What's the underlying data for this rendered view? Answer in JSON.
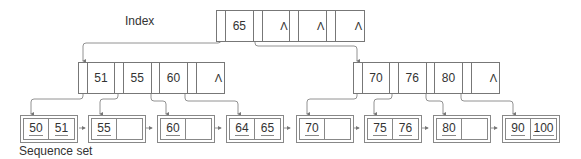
{
  "labels": {
    "index": "Index",
    "sequence_set": "Sequence set"
  },
  "root": {
    "keys": [
      "65",
      "",
      "",
      ""
    ],
    "null_markers": [
      "Λ",
      "Λ",
      "Λ"
    ]
  },
  "internal_nodes": [
    {
      "keys": [
        "51",
        "55",
        "60",
        ""
      ],
      "null_marker": "Λ"
    },
    {
      "keys": [
        "70",
        "76",
        "80",
        ""
      ],
      "null_marker": "Λ"
    }
  ],
  "leaves": [
    {
      "keys": [
        "50",
        "51"
      ]
    },
    {
      "keys": [
        "55",
        ""
      ]
    },
    {
      "keys": [
        "60",
        ""
      ]
    },
    {
      "keys": [
        "64",
        "65"
      ]
    },
    {
      "keys": [
        "70",
        ""
      ]
    },
    {
      "keys": [
        "75",
        "76"
      ]
    },
    {
      "keys": [
        "80",
        ""
      ]
    },
    {
      "keys": [
        "90",
        "100"
      ]
    }
  ],
  "colors": {
    "line": "#777777",
    "text": "#333333"
  }
}
